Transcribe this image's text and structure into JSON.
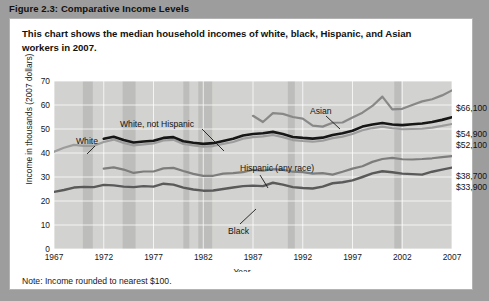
{
  "figure": {
    "title": "Figure 2.3:  Comparative Income Levels",
    "subtitle": "This chart shows the median household incomes of white, black, Hispanic, and Asian workers in 2007.",
    "note": "Note: Income rounded to nearest $100."
  },
  "legend": {
    "recession_label": "Recession",
    "recession_color": "#cdcdcd",
    "position": "top-right"
  },
  "endpoint_labels": [
    {
      "name": "asian-end-value",
      "text": "$66,100",
      "top": "84px"
    },
    {
      "name": "white-not-hispanic-end-value",
      "text": "$54,900",
      "top": "110px"
    },
    {
      "name": "white-end-value",
      "text": "$52,100",
      "top": "121px"
    },
    {
      "name": "hispanic-end-value",
      "text": "$38,700",
      "top": "152px"
    },
    {
      "name": "black-end-value",
      "text": "$33,900",
      "top": "163px"
    }
  ],
  "series_annotations": [
    {
      "name": "white-series-label",
      "text": "White",
      "left": "66px",
      "top": "117px"
    },
    {
      "name": "white-not-hispanic-series-label",
      "text": "White, not Hispanic",
      "left": "110px",
      "top": "100px"
    },
    {
      "name": "asian-series-label",
      "text": "Asian",
      "left": "300px",
      "top": "87px"
    },
    {
      "name": "hispanic-series-label",
      "text": "Hispanic (any race)",
      "left": "230px",
      "top": "144px"
    },
    {
      "name": "black-series-label",
      "text": "Black",
      "left": "218px",
      "top": "207px"
    }
  ],
  "chart_data": {
    "type": "line",
    "title": "Comparative Income Levels",
    "xlabel": "Year",
    "ylabel": "Income in thousands (2007 dollars)",
    "xlim": [
      1967,
      2007
    ],
    "ylim": [
      0,
      70
    ],
    "ytick_labels": [
      "0",
      "10",
      "20",
      "30",
      "40",
      "50",
      "60",
      "70"
    ],
    "ytick_values": [
      0,
      10,
      20,
      30,
      40,
      50,
      60,
      70
    ],
    "xtick_labels": [
      "1967",
      "1972",
      "1977",
      "1982",
      "1987",
      "1992",
      "1997",
      "2002",
      "2007"
    ],
    "xtick_values": [
      1967,
      1972,
      1977,
      1982,
      1987,
      1992,
      1997,
      2002,
      2007
    ],
    "grid": true,
    "legend": "Recession shading",
    "recession_bands": [
      [
        1969.9,
        1970.9
      ],
      [
        1973.9,
        1975.2
      ],
      [
        1980.0,
        1980.6
      ],
      [
        1981.5,
        1982.9
      ],
      [
        1990.5,
        1991.2
      ],
      [
        2001.2,
        2001.9
      ]
    ],
    "series": [
      {
        "name": "White",
        "color": "#9c9c9c",
        "width": 2.2,
        "x": [
          1967,
          1968,
          1969,
          1970,
          1971,
          1972,
          1973,
          1974,
          1975,
          1976,
          1977,
          1978,
          1979,
          1980,
          1981,
          1982,
          1983,
          1984,
          1985,
          1986,
          1987,
          1988,
          1989,
          1990,
          1991,
          1992,
          1993,
          1994,
          1995,
          1996,
          1997,
          1998,
          1999,
          2000,
          2001,
          2002,
          2003,
          2004,
          2005,
          2006,
          2007
        ],
        "values": [
          40.5,
          42.2,
          43.4,
          43.0,
          43.0,
          44.6,
          45.6,
          44.2,
          43.2,
          43.6,
          44.0,
          45.2,
          45.5,
          43.8,
          43.2,
          42.6,
          42.9,
          43.8,
          44.6,
          46.0,
          46.6,
          46.9,
          47.5,
          46.6,
          45.4,
          45.0,
          44.7,
          45.1,
          46.2,
          46.8,
          47.9,
          49.5,
          50.4,
          51.0,
          50.3,
          49.9,
          50.0,
          50.1,
          50.6,
          51.3,
          52.1
        ]
      },
      {
        "name": "White, not Hispanic",
        "color": "#171717",
        "width": 2.6,
        "x": [
          1972,
          1973,
          1974,
          1975,
          1976,
          1977,
          1978,
          1979,
          1980,
          1981,
          1982,
          1983,
          1984,
          1985,
          1986,
          1987,
          1988,
          1989,
          1990,
          1991,
          1992,
          1993,
          1994,
          1995,
          1996,
          1997,
          1998,
          1999,
          2000,
          2001,
          2002,
          2003,
          2004,
          2005,
          2006,
          2007
        ],
        "values": [
          45.9,
          46.8,
          45.4,
          44.4,
          44.8,
          45.1,
          46.3,
          46.6,
          44.9,
          44.3,
          43.8,
          44.1,
          45.0,
          45.9,
          47.3,
          47.9,
          48.2,
          48.8,
          47.9,
          46.7,
          46.3,
          46.0,
          46.4,
          47.5,
          48.2,
          49.3,
          51.0,
          51.9,
          52.5,
          51.9,
          51.6,
          52.0,
          52.3,
          52.9,
          53.8,
          54.9
        ]
      },
      {
        "name": "Asian",
        "color": "#888888",
        "width": 2.2,
        "x": [
          1987,
          1988,
          1989,
          1990,
          1991,
          1992,
          1993,
          1994,
          1995,
          1996,
          1997,
          1998,
          1999,
          2000,
          2001,
          2002,
          2003,
          2004,
          2005,
          2006,
          2007
        ],
        "values": [
          55.5,
          52.9,
          56.6,
          56.3,
          55.0,
          54.3,
          51.4,
          51.0,
          52.6,
          52.7,
          54.8,
          56.8,
          59.6,
          63.5,
          58.2,
          58.4,
          60.0,
          61.5,
          62.4,
          64.0,
          66.1
        ]
      },
      {
        "name": "Hispanic (any race)",
        "color": "#7d7d7d",
        "width": 2.2,
        "x": [
          1972,
          1973,
          1974,
          1975,
          1976,
          1977,
          1978,
          1979,
          1980,
          1981,
          1982,
          1983,
          1984,
          1985,
          1986,
          1987,
          1988,
          1989,
          1990,
          1991,
          1992,
          1993,
          1994,
          1995,
          1996,
          1997,
          1998,
          1999,
          2000,
          2001,
          2002,
          2003,
          2004,
          2005,
          2006,
          2007
        ],
        "values": [
          33.5,
          34.0,
          33.1,
          31.7,
          32.3,
          32.3,
          33.6,
          33.8,
          32.5,
          31.3,
          30.5,
          30.5,
          31.4,
          31.6,
          32.0,
          33.0,
          32.6,
          33.3,
          33.0,
          32.2,
          32.0,
          31.4,
          31.6,
          31.0,
          32.2,
          33.5,
          34.5,
          36.3,
          37.5,
          38.0,
          37.4,
          37.3,
          37.5,
          37.8,
          38.3,
          38.7
        ]
      },
      {
        "name": "Black",
        "color": "#5a5a5a",
        "width": 2.4,
        "x": [
          1967,
          1968,
          1969,
          1970,
          1971,
          1972,
          1973,
          1974,
          1975,
          1976,
          1977,
          1978,
          1979,
          1980,
          1981,
          1982,
          1983,
          1984,
          1985,
          1986,
          1987,
          1988,
          1989,
          1990,
          1991,
          1992,
          1993,
          1994,
          1995,
          1996,
          1997,
          1998,
          1999,
          2000,
          2001,
          2002,
          2003,
          2004,
          2005,
          2006,
          2007
        ],
        "values": [
          23.8,
          24.6,
          25.6,
          25.9,
          25.8,
          26.7,
          26.5,
          26.0,
          25.8,
          26.2,
          26.0,
          27.2,
          26.8,
          25.6,
          24.8,
          24.3,
          24.4,
          25.0,
          25.6,
          26.2,
          26.4,
          26.2,
          27.6,
          26.8,
          25.8,
          25.4,
          25.2,
          26.0,
          27.4,
          27.8,
          28.6,
          30.0,
          31.5,
          32.4,
          32.0,
          31.4,
          31.2,
          31.0,
          32.2,
          33.1,
          33.9
        ]
      }
    ]
  }
}
